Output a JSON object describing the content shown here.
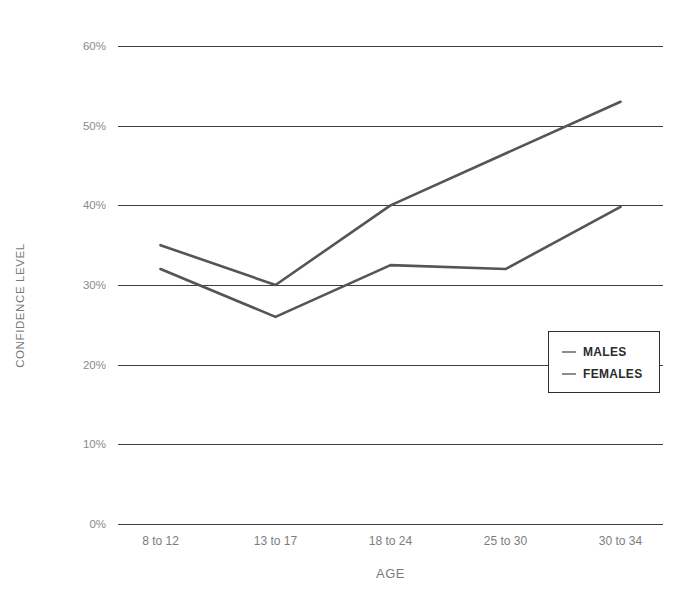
{
  "chart_data": {
    "type": "line",
    "title": "",
    "xlabel": "AGE",
    "ylabel": "CONFIDENCE LEVEL",
    "categories": [
      "8 to 12",
      "13 to 17",
      "18 to 24",
      "25 to 30",
      "30 to 34"
    ],
    "ylim": [
      0,
      60
    ],
    "yticks": [
      0,
      10,
      20,
      30,
      40,
      50,
      60
    ],
    "ytick_labels": [
      "0%",
      "10%",
      "20%",
      "30%",
      "40%",
      "50%",
      "60%"
    ],
    "grid": true,
    "legend_position": "bottom-right",
    "series": [
      {
        "name": "MALES",
        "color": "#555555",
        "values": [
          35,
          30,
          40,
          46.5,
          53
        ]
      },
      {
        "name": "FEMALES",
        "color": "#555555",
        "values": [
          32,
          26,
          32.5,
          32,
          39.8
        ]
      }
    ]
  },
  "legend": {
    "items": [
      {
        "label": "MALES"
      },
      {
        "label": "FEMALES"
      }
    ]
  },
  "colors": {
    "gridline": "#3f3f3f",
    "line": "#555555",
    "tick_text": "#8a8a8a",
    "axis_title": "#7a7a7a",
    "legend_border": "#2e2e2e",
    "legend_text": "#2b2b2b",
    "background": "#ffffff"
  }
}
